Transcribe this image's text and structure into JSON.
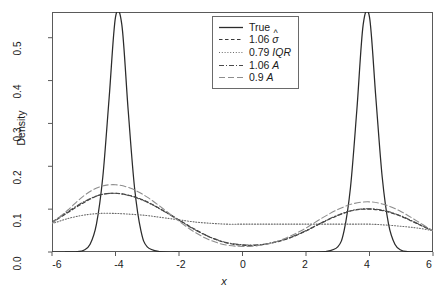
{
  "chart_data": {
    "type": "line",
    "title": "",
    "xlabel": "x",
    "ylabel": "Density",
    "xlim": [
      -6,
      6
    ],
    "ylim": [
      0.0,
      0.56
    ],
    "xticks": [
      -6,
      -2,
      2,
      6,
      -4,
      0,
      4
    ],
    "xtick_labels": [
      "-6",
      "-4",
      "-2",
      "0",
      "2",
      "4",
      "6"
    ],
    "xtick_values": [
      -6,
      -4,
      -2,
      0,
      2,
      4,
      6
    ],
    "ytick_labels": [
      "0.0",
      "0.1",
      "0.2",
      "0.3",
      "0.4",
      "0.5"
    ],
    "ytick_values": [
      0.0,
      0.1,
      0.2,
      0.3,
      0.4,
      0.5
    ],
    "grid": false,
    "legend_position": "top-center",
    "series": [
      {
        "name": "True",
        "style": "solid",
        "color": "#2b2b2b",
        "x": [
          -6,
          -5.6,
          -5.2,
          -5.0,
          -4.8,
          -4.6,
          -4.4,
          -4.2,
          -4.0,
          -3.8,
          -3.6,
          -3.4,
          -3.2,
          -3.0,
          -2.6,
          -2.0,
          -1.0,
          0.0,
          1.0,
          2.0,
          2.6,
          3.0,
          3.2,
          3.4,
          3.6,
          3.8,
          4.0,
          4.2,
          4.4,
          4.6,
          4.8,
          5.0,
          5.2,
          5.6,
          6.0
        ],
        "values": [
          0.0,
          0.0,
          0.001,
          0.004,
          0.018,
          0.065,
          0.175,
          0.36,
          0.548,
          0.53,
          0.33,
          0.15,
          0.05,
          0.012,
          0.001,
          0.0,
          0.0,
          0.0,
          0.0,
          0.0,
          0.001,
          0.012,
          0.05,
          0.15,
          0.33,
          0.53,
          0.548,
          0.36,
          0.175,
          0.065,
          0.018,
          0.004,
          0.001,
          0.0,
          0.0
        ]
      },
      {
        "name": "1.06 sigma-hat",
        "label_prefix": "1.06",
        "label_symbol": "σ",
        "label_accent": "hat",
        "style": "dashed",
        "color": "#3a3a3a",
        "x": [
          -6,
          -5.5,
          -5,
          -4.5,
          -4,
          -3.5,
          -3,
          -2.5,
          -2,
          -1.5,
          -1,
          -0.5,
          0,
          0.5,
          1,
          1.5,
          2,
          2.5,
          3,
          3.5,
          4,
          4.5,
          5,
          5.5,
          6
        ],
        "values": [
          0.068,
          0.092,
          0.115,
          0.133,
          0.137,
          0.131,
          0.117,
          0.097,
          0.075,
          0.053,
          0.034,
          0.021,
          0.016,
          0.016,
          0.022,
          0.033,
          0.049,
          0.068,
          0.085,
          0.097,
          0.1,
          0.095,
          0.083,
          0.066,
          0.049
        ]
      },
      {
        "name": "0.79 IQR",
        "label_prefix": "0.79",
        "label_symbol": "IQR",
        "style": "dotted",
        "color": "#6a6a6a",
        "x": [
          -6,
          -5.5,
          -5,
          -4.5,
          -4,
          -3.5,
          -3,
          -2.5,
          -2,
          -1.5,
          -1,
          -0.5,
          0,
          0.5,
          1,
          1.5,
          2,
          2.5,
          3,
          3.5,
          4,
          4.5,
          5,
          5.5,
          6
        ],
        "values": [
          0.066,
          0.078,
          0.086,
          0.09,
          0.09,
          0.088,
          0.085,
          0.08,
          0.075,
          0.07,
          0.067,
          0.065,
          0.065,
          0.065,
          0.065,
          0.065,
          0.065,
          0.065,
          0.065,
          0.065,
          0.065,
          0.063,
          0.06,
          0.056,
          0.05
        ]
      },
      {
        "name": "1.06 A",
        "label_prefix": "1.06",
        "label_symbol": "A",
        "style": "dashdot",
        "color": "#4a4a4a",
        "x": [
          -6,
          -5.5,
          -5,
          -4.5,
          -4,
          -3.5,
          -3,
          -2.5,
          -2,
          -1.5,
          -1,
          -0.5,
          0,
          0.5,
          1,
          1.5,
          2,
          2.5,
          3,
          3.5,
          4,
          4.5,
          5,
          5.5,
          6
        ],
        "values": [
          0.07,
          0.094,
          0.117,
          0.133,
          0.137,
          0.13,
          0.116,
          0.096,
          0.074,
          0.052,
          0.034,
          0.022,
          0.017,
          0.017,
          0.023,
          0.034,
          0.05,
          0.069,
          0.086,
          0.098,
          0.101,
          0.096,
          0.084,
          0.067,
          0.05
        ]
      },
      {
        "name": "0.9 A",
        "label_prefix": "0.9",
        "label_symbol": "A",
        "style": "longdash",
        "color": "#8d8d8d",
        "x": [
          -6,
          -5.5,
          -5,
          -4.5,
          -4,
          -3.5,
          -3,
          -2.5,
          -2,
          -1.5,
          -1,
          -0.5,
          0,
          0.5,
          1,
          1.5,
          2,
          2.5,
          3,
          3.5,
          4,
          4.5,
          5,
          5.5,
          6
        ],
        "values": [
          0.067,
          0.098,
          0.131,
          0.152,
          0.157,
          0.148,
          0.128,
          0.101,
          0.072,
          0.046,
          0.027,
          0.016,
          0.013,
          0.015,
          0.023,
          0.037,
          0.056,
          0.079,
          0.099,
          0.113,
          0.117,
          0.11,
          0.094,
          0.072,
          0.049
        ]
      }
    ]
  },
  "legend": {
    "entries": [
      {
        "label": "True",
        "symbol": "",
        "accent": ""
      },
      {
        "label": "1.06",
        "symbol": "σ",
        "accent": "hat"
      },
      {
        "label": "0.79",
        "symbol": "IQR",
        "accent": ""
      },
      {
        "label": "1.06",
        "symbol": "A",
        "accent": ""
      },
      {
        "label": "0.9",
        "symbol": "A",
        "accent": ""
      }
    ]
  },
  "axes": {
    "y_title": "Density",
    "x_title": "x",
    "y_ticks": [
      "0.0",
      "0.1",
      "0.2",
      "0.3",
      "0.4",
      "0.5"
    ],
    "x_ticks": [
      "-6",
      "-4",
      "-2",
      "0",
      "2",
      "4",
      "6"
    ]
  }
}
